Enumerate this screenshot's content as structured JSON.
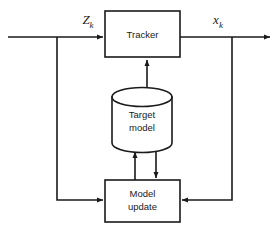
{
  "diagram": {
    "type": "block-diagram",
    "background_color": "#ffffff",
    "line_color": "#1a1a1a",
    "nodes": [
      {
        "id": "tracker",
        "label": "Tracker",
        "shape": "rectangle",
        "x": 105,
        "y": 11,
        "width": 75,
        "height": 46
      },
      {
        "id": "target-model",
        "label_line1": "Target",
        "label_line2": "model",
        "shape": "cylinder",
        "x": 112,
        "y": 88,
        "width": 60,
        "height": 64
      },
      {
        "id": "model-update",
        "label_line1": "Model",
        "label_line2": "update",
        "shape": "rectangle",
        "x": 105,
        "y": 180,
        "width": 75,
        "height": 42
      }
    ],
    "signals": [
      {
        "id": "input-measurement",
        "base": "Z",
        "subscript": "k",
        "label_x": 88,
        "label_y": 22
      },
      {
        "id": "output-state",
        "base": "x",
        "subscript": "k",
        "label_x": 218,
        "label_y": 22
      }
    ],
    "edges": [
      {
        "id": "input-to-tracker",
        "from": "input",
        "to": "tracker",
        "arrow": true
      },
      {
        "id": "tracker-to-output",
        "from": "tracker",
        "to": "output",
        "arrow": true
      },
      {
        "id": "input-branch-to-model-update",
        "from": "input",
        "to": "model-update",
        "arrow": true
      },
      {
        "id": "output-branch-to-model-update",
        "from": "output",
        "to": "model-update",
        "arrow": true
      },
      {
        "id": "target-model-to-tracker",
        "from": "target-model",
        "to": "tracker",
        "arrow": true
      },
      {
        "id": "model-update-to-target-model",
        "from": "model-update",
        "to": "target-model",
        "arrow": true
      },
      {
        "id": "target-model-to-model-update",
        "from": "target-model",
        "to": "model-update",
        "arrow": true
      }
    ]
  }
}
